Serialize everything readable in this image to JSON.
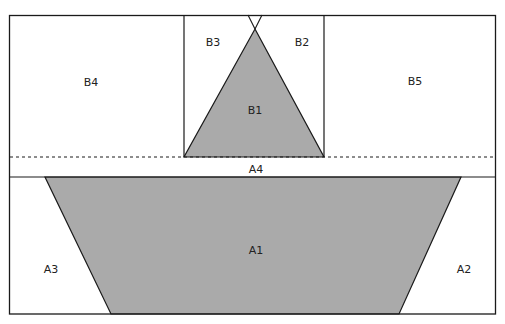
{
  "diagram": {
    "type": "quilt-block-template",
    "colors": {
      "fill": "#aaaaaa",
      "stroke": "#1a1a1a",
      "background": "#ffffff"
    },
    "sections": {
      "B": [
        "B1",
        "B2",
        "B3",
        "B4",
        "B5"
      ],
      "A": [
        "A1",
        "A2",
        "A3",
        "A4"
      ]
    },
    "labels": {
      "B1": "B1",
      "B2": "B2",
      "B3": "B3",
      "B4": "B4",
      "B5": "B5",
      "A1": "A1",
      "A2": "A2",
      "A3": "A3",
      "A4": "A4"
    },
    "seam_line": "dashed"
  }
}
